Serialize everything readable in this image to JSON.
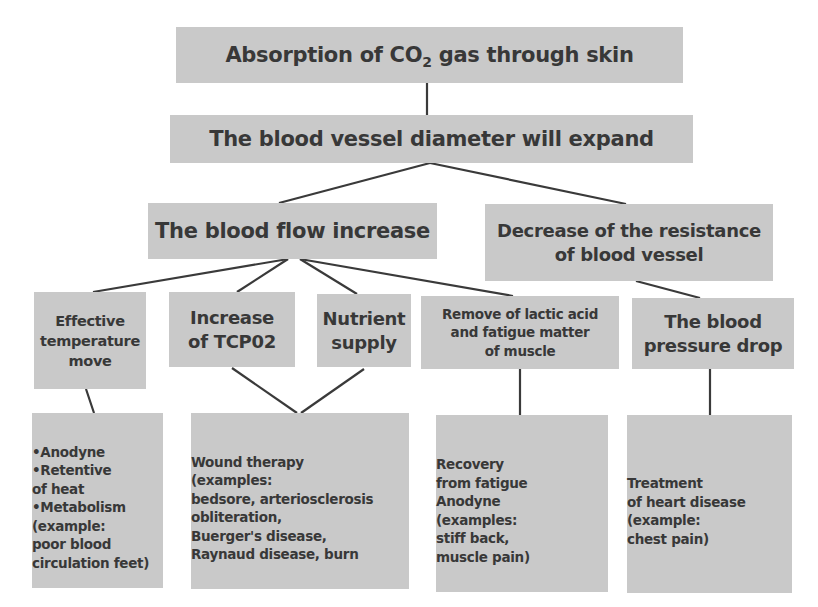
{
  "diagram": {
    "root": {
      "text_before_sub": "Absorption of CO",
      "subscript": "2",
      "text_after_sub": " gas through skin"
    },
    "level1": {
      "text": "The blood vessel diameter will expand"
    },
    "level2": [
      {
        "lines": [
          "The blood flow increase"
        ]
      },
      {
        "lines": [
          "Decrease of the resistance",
          "of blood vessel"
        ]
      }
    ],
    "level3": [
      {
        "lines": [
          "Effective",
          "temperature",
          "move"
        ]
      },
      {
        "lines": [
          "Increase",
          "of TCP02"
        ]
      },
      {
        "lines": [
          "Nutrient",
          "supply"
        ]
      },
      {
        "lines": [
          "Remove of lactic acid",
          "and fatigue matter",
          "of muscle"
        ]
      },
      {
        "lines": [
          "The blood",
          "pressure drop"
        ]
      }
    ],
    "level4": [
      {
        "lines": [
          "•Anodyne",
          "•Retentive",
          "of heat",
          "•Metabolism",
          "(example:",
          "poor blood",
          "circulation feet)"
        ]
      },
      {
        "lines": [
          "Wound therapy",
          "(examples:",
          "bedsore, arteriosclerosis",
          "obliteration,",
          "Buerger's disease,",
          "Raynaud disease, burn"
        ]
      },
      {
        "lines": [
          "Recovery",
          "from fatigue",
          "Anodyne",
          "(examples:",
          "stiff back,",
          "muscle pain)"
        ]
      },
      {
        "lines": [
          "Treatment",
          "of heart disease",
          "(example:",
          "chest pain)"
        ]
      }
    ],
    "colors": {
      "box_fill": "#c9c9c9",
      "text": "#383838",
      "connector": "#3a3a3a",
      "background": "#ffffff"
    }
  }
}
